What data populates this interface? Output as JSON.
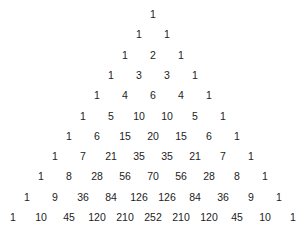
{
  "layout": {
    "center_x": 153,
    "top_y": 14,
    "dx": 28,
    "dy": 20.3
  },
  "rows": [
    [
      1
    ],
    [
      1,
      1
    ],
    [
      1,
      2,
      1
    ],
    [
      1,
      3,
      3,
      1
    ],
    [
      1,
      4,
      6,
      4,
      1
    ],
    [
      1,
      5,
      10,
      10,
      5,
      1
    ],
    [
      1,
      6,
      15,
      20,
      15,
      6,
      1
    ],
    [
      1,
      7,
      21,
      35,
      35,
      21,
      7,
      1
    ],
    [
      1,
      8,
      28,
      56,
      70,
      56,
      28,
      8,
      1
    ],
    [
      1,
      9,
      36,
      84,
      126,
      126,
      84,
      36,
      9,
      1
    ],
    [
      1,
      10,
      45,
      120,
      210,
      252,
      210,
      120,
      45,
      10,
      1
    ]
  ]
}
